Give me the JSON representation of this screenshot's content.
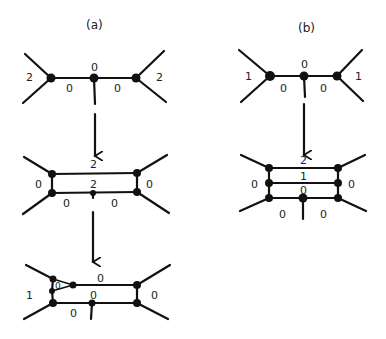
{
  "panels": {
    "a": {
      "label": "(a)"
    },
    "b": {
      "label": "(b)"
    }
  },
  "a_top": {
    "left": "2",
    "mid_top": "0",
    "right": "2",
    "edge_left": "0",
    "edge_right": "0"
  },
  "a_mid": {
    "top": "2",
    "inner": "2",
    "left": "0",
    "right": "0",
    "bottom_left": "0",
    "bottom_right": "0"
  },
  "a_bot": {
    "top": "0",
    "inner": "0",
    "left": "1",
    "right": "0",
    "bottom_left": "0",
    "triangle": "0"
  },
  "b_top": {
    "left": "1",
    "mid_top": "0",
    "right": "1",
    "edge_left": "0",
    "edge_right": "0"
  },
  "b_mid": {
    "top": "2",
    "middle": "1",
    "inner": "0",
    "left": "0",
    "right": "0",
    "bottom_left": "0",
    "bottom_right": "0"
  }
}
